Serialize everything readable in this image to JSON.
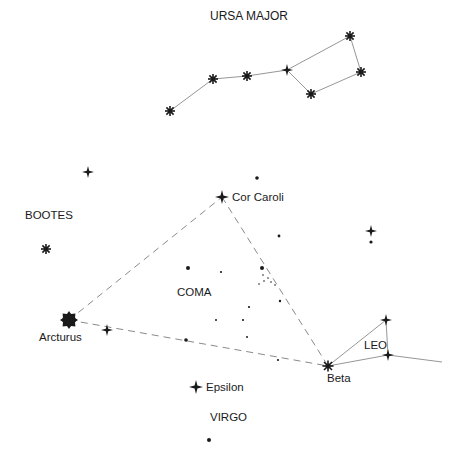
{
  "labels": {
    "ursa_major": "URSA  MAJOR",
    "bootes": "BOOTES",
    "cor_caroli": "Cor Caroli",
    "coma": "COMA",
    "arcturus": "Arcturus",
    "leo": "LEO",
    "beta": "Beta",
    "epsilon": "Epsilon",
    "virgo": "VIRGO"
  },
  "colors": {
    "ink": "#1a1a1a",
    "line": "#8a8a8a"
  },
  "stars": {
    "ursa_major": [
      [
        170,
        111
      ],
      [
        213,
        79
      ],
      [
        247,
        76
      ],
      [
        287,
        70
      ],
      [
        350,
        36
      ],
      [
        361,
        72
      ],
      [
        311,
        94
      ]
    ],
    "arcturus": [
      69,
      320
    ],
    "cor_caroli": [
      222,
      197
    ],
    "beta": [
      328,
      366
    ],
    "epsilon": [
      196,
      387
    ],
    "leo": [
      [
        386,
        320
      ],
      [
        388,
        355
      ]
    ],
    "others_cross": [
      [
        88,
        172
      ],
      [
        107,
        330
      ],
      [
        371,
        231
      ]
    ],
    "bootes_star": [
      46,
      249
    ],
    "dots": [
      [
        257,
        178
      ],
      [
        279,
        236
      ],
      [
        188,
        268
      ],
      [
        221,
        272
      ],
      [
        262,
        268
      ],
      [
        280,
        301
      ],
      [
        249,
        307
      ],
      [
        216,
        320
      ],
      [
        243,
        320
      ],
      [
        247,
        337
      ],
      [
        186,
        340
      ],
      [
        278,
        360
      ],
      [
        371,
        242
      ],
      [
        209,
        440
      ]
    ],
    "cluster": [
      [
        264,
        281
      ],
      [
        268,
        278
      ],
      [
        271,
        282
      ],
      [
        275,
        285
      ],
      [
        259,
        284
      ],
      [
        262,
        275
      ]
    ]
  }
}
